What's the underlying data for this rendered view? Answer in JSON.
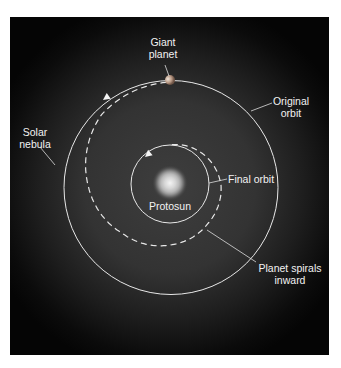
{
  "diagram": {
    "labels": {
      "giant_planet_line1": "Giant",
      "giant_planet_line2": "planet",
      "original_orbit_line1": "Original",
      "original_orbit_line2": "orbit",
      "solar_nebula_line1": "Solar",
      "solar_nebula_line2": "nebula",
      "final_orbit": "Final orbit",
      "protosun": "Protosun",
      "planet_spirals_line1": "Planet spirals",
      "planet_spirals_line2": "inward"
    },
    "elements": [
      {
        "name": "solar-nebula",
        "kind": "glow"
      },
      {
        "name": "protosun",
        "kind": "star"
      },
      {
        "name": "original-orbit",
        "kind": "circle",
        "style": "solid"
      },
      {
        "name": "final-orbit",
        "kind": "circle",
        "style": "solid"
      },
      {
        "name": "inward-spiral-path",
        "kind": "spiral",
        "style": "dashed",
        "direction": "counterclockwise",
        "from": "original-orbit",
        "to": "final-orbit"
      },
      {
        "name": "giant-planet",
        "kind": "planet",
        "position": "top of original orbit"
      }
    ],
    "relative_orbit_radius": {
      "original": 1.0,
      "final": 0.37
    },
    "colors": {
      "background": "#050505",
      "nebula": "#3c3c3c",
      "orbit_line": "#e8e8e8",
      "text": "#f2f2f2",
      "page": "#ffffff"
    }
  }
}
